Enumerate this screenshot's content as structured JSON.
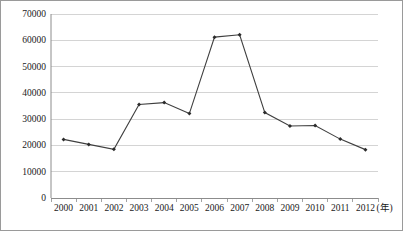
{
  "chart_data": {
    "type": "line",
    "title": "",
    "subtitle": "",
    "xlabel": "(年)",
    "ylabel": "",
    "categories": [
      "2000",
      "2001",
      "2002",
      "2003",
      "2004",
      "2005",
      "2006",
      "2007",
      "2008",
      "2009",
      "2010",
      "2011",
      "2012"
    ],
    "values": [
      22300,
      20400,
      18500,
      35600,
      36300,
      32100,
      61200,
      62100,
      32500,
      27400,
      27600,
      22400,
      18400
    ],
    "series": [
      {
        "name": "",
        "values": [
          22300,
          20400,
          18500,
          35600,
          36300,
          32100,
          61200,
          62100,
          32500,
          27400,
          27600,
          22400,
          18400
        ]
      }
    ],
    "ylim": [
      0,
      70000
    ],
    "yticks": [
      0,
      10000,
      20000,
      30000,
      40000,
      50000,
      60000,
      70000
    ],
    "ytick_labels": [
      "0",
      "10000",
      "20000",
      "30000",
      "40000",
      "50000",
      "60000",
      "70000"
    ],
    "xtick_labels": [
      "2000",
      "2001",
      "2002",
      "2003",
      "2004",
      "2005",
      "2006",
      "2007",
      "2008",
      "2009",
      "2010",
      "2011",
      "2012"
    ],
    "grid": "horizontal",
    "legend": "none",
    "marker": "diamond",
    "annotations": []
  },
  "style": {
    "line_color": "#3f3f3f",
    "marker_color": "#2b2b2b",
    "grid_color": "#c9c9c9",
    "axis_color": "#8c8c8c",
    "border_color": "#9a9a9a",
    "text_color": "#1a1a1a",
    "background": "#ffffff"
  },
  "axis_unit": {
    "x_unit_text": "(年)"
  }
}
